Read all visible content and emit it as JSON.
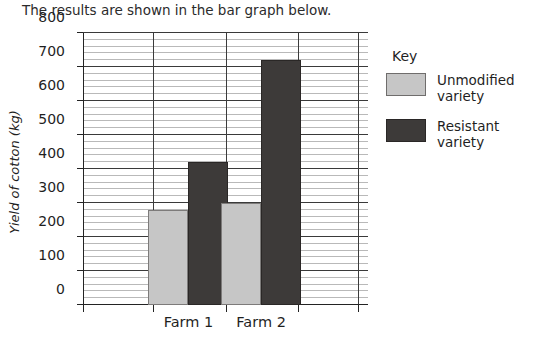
{
  "intro": {
    "text": "The results are shown in the bar graph below."
  },
  "legend": {
    "title": "Key",
    "entries": [
      {
        "label_line1": "Unmodified",
        "label_line2": "variety",
        "color": "#c6c6c6",
        "swatch_name": "unmodified-variety-swatch"
      },
      {
        "label_line1": "Resistant",
        "label_line2": "variety",
        "color": "#3d3a39",
        "swatch_name": "resistant-variety-swatch"
      }
    ]
  },
  "chart_data": {
    "type": "bar",
    "title": "",
    "xlabel": "",
    "ylabel": "Yield of cotton (kg)",
    "categories": [
      "Farm 1",
      "Farm 2"
    ],
    "series": [
      {
        "name": "Unmodified variety",
        "values": [
          280,
          300
        ],
        "color": "#c6c6c6"
      },
      {
        "name": "Resistant variety",
        "values": [
          420,
          720
        ],
        "color": "#3d3a39"
      }
    ],
    "ylim": [
      0,
      800
    ],
    "ytick_step": 100,
    "yticks": [
      0,
      100,
      200,
      300,
      400,
      500,
      600,
      700,
      800
    ],
    "ytick_labels": [
      "0",
      "100",
      "200",
      "300",
      "400",
      "500",
      "600",
      "700",
      "800"
    ],
    "minor_gridline_step": 20,
    "grid": true,
    "legend_position": "right"
  }
}
